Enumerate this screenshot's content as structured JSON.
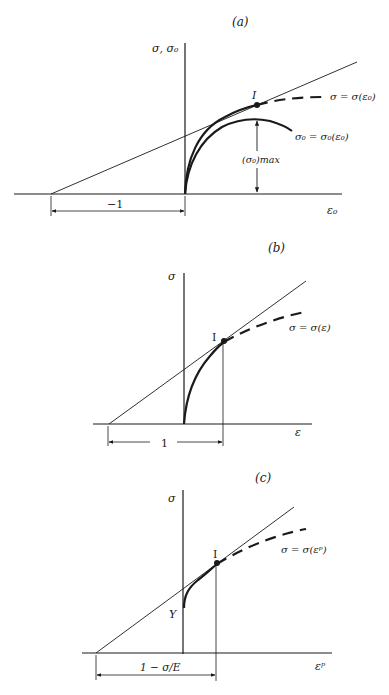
{
  "figure": {
    "panels": [
      {
        "id": "a",
        "label": "(a)",
        "y_axis_label": "σ, σ₀",
        "x_axis_label": "ε₀",
        "point_label": "I",
        "dashed_curve_label": "σ = σ(ε₀)",
        "solid_curve_label": "σ₀ = σ₀(ε₀)",
        "max_label": "(σ₀)max",
        "dimension_label": "−1"
      },
      {
        "id": "b",
        "label": "(b)",
        "y_axis_label": "σ",
        "x_axis_label": "ε",
        "point_label": "I",
        "dashed_curve_label": "σ = σ(ε)",
        "dimension_label": "1"
      },
      {
        "id": "c",
        "label": "(c)",
        "y_axis_label": "σ",
        "x_axis_label": "εᵖ",
        "point_label": "I",
        "yield_label": "Y",
        "dashed_curve_label": "σ = σ(εᵖ)",
        "dimension_label": "1 − σ/E"
      }
    ],
    "colors": {
      "ink": "#1a1a1a",
      "background": "#ffffff"
    }
  }
}
